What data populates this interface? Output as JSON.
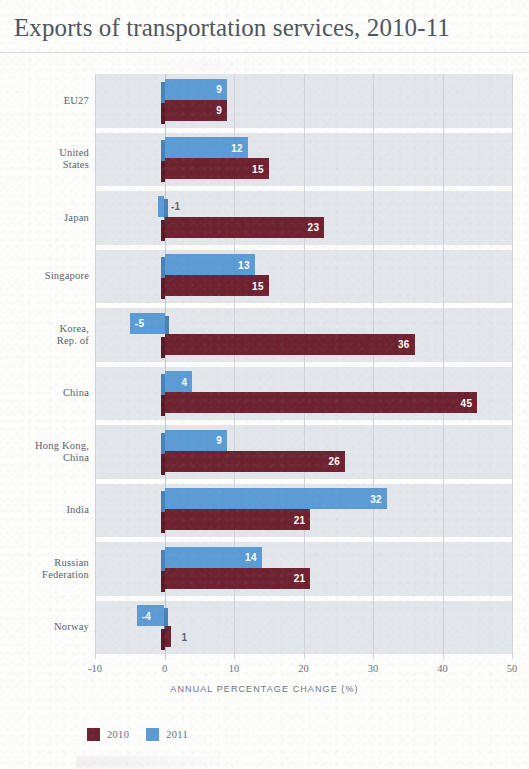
{
  "title": "Exports of transportation services, 2010-11",
  "axis": {
    "x_title": "ANNUAL PERCENTAGE CHANGE (%)",
    "ticks": [
      "-10",
      "0",
      "10",
      "20",
      "30",
      "40",
      "50"
    ]
  },
  "legend": [
    {
      "label": "2010",
      "color": "#6e2230"
    },
    {
      "label": "2011",
      "color": "#5b9bd5"
    }
  ],
  "chart_data": {
    "type": "bar",
    "orientation": "horizontal",
    "title": "Exports of transportation services, 2010-11",
    "xlabel": "ANNUAL PERCENTAGE CHANGE (%)",
    "ylabel": "",
    "xlim": [
      -10,
      50
    ],
    "xticks": [
      -10,
      0,
      10,
      20,
      30,
      40,
      50
    ],
    "grid": true,
    "legend_position": "bottom-left",
    "categories": [
      "EU27",
      "United States",
      "Japan",
      "Singapore",
      "Korea, Rep. of",
      "China",
      "Hong Kong, China",
      "India",
      "Russian Federation",
      "Norway"
    ],
    "category_lines": [
      [
        "EU27"
      ],
      [
        "United",
        "States"
      ],
      [
        "Japan"
      ],
      [
        "Singapore"
      ],
      [
        "Korea,",
        "Rep. of"
      ],
      [
        "China"
      ],
      [
        "Hong Kong,",
        "China"
      ],
      [
        "India"
      ],
      [
        "Russian",
        "Federation"
      ],
      [
        "Norway"
      ]
    ],
    "series": [
      {
        "name": "2010",
        "color": "#6e2230",
        "values": [
          9,
          15,
          23,
          15,
          36,
          45,
          26,
          21,
          21,
          1
        ]
      },
      {
        "name": "2011",
        "color": "#5b9bd5",
        "values": [
          9,
          12,
          -1,
          13,
          -5,
          4,
          9,
          32,
          14,
          -4
        ]
      }
    ]
  }
}
